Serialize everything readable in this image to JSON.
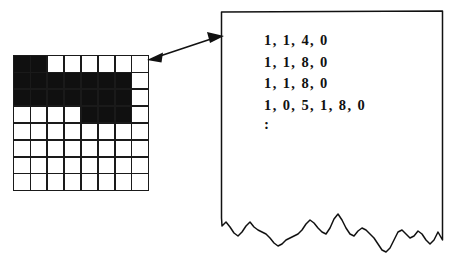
{
  "figure": {
    "background_color": "#ffffff",
    "ink_color": "#111111"
  },
  "bitmap": {
    "name": "binary-image-grid",
    "columns": 8,
    "rows": 8,
    "on_color": "#101010",
    "off_color": "#ffffff",
    "line_color": "#1a1a1a",
    "pixels": [
      [
        1,
        1,
        0,
        0,
        0,
        0,
        0,
        0
      ],
      [
        1,
        1,
        1,
        1,
        1,
        1,
        1,
        0
      ],
      [
        1,
        1,
        1,
        1,
        1,
        1,
        1,
        0
      ],
      [
        0,
        0,
        0,
        0,
        1,
        1,
        1,
        0
      ],
      [
        0,
        0,
        0,
        0,
        0,
        0,
        0,
        0
      ],
      [
        0,
        0,
        0,
        0,
        0,
        0,
        0,
        0
      ],
      [
        0,
        0,
        0,
        0,
        0,
        0,
        0,
        0
      ],
      [
        0,
        0,
        0,
        0,
        0,
        0,
        0,
        0
      ]
    ]
  },
  "connector": {
    "name": "double-headed-arrow",
    "label": "",
    "from": "bitmap-grid",
    "to": "code-sheet"
  },
  "sheet": {
    "name": "torn-paper-sheet",
    "edge_color": "#111111",
    "fill_color": "#ffffff",
    "code_lines": [
      "1, 1, 4, 0",
      "1, 1, 8, 0",
      "1, 1, 8, 0",
      "1, 0, 5, 1, 8, 0"
    ],
    "continuation_symbol": ":"
  }
}
